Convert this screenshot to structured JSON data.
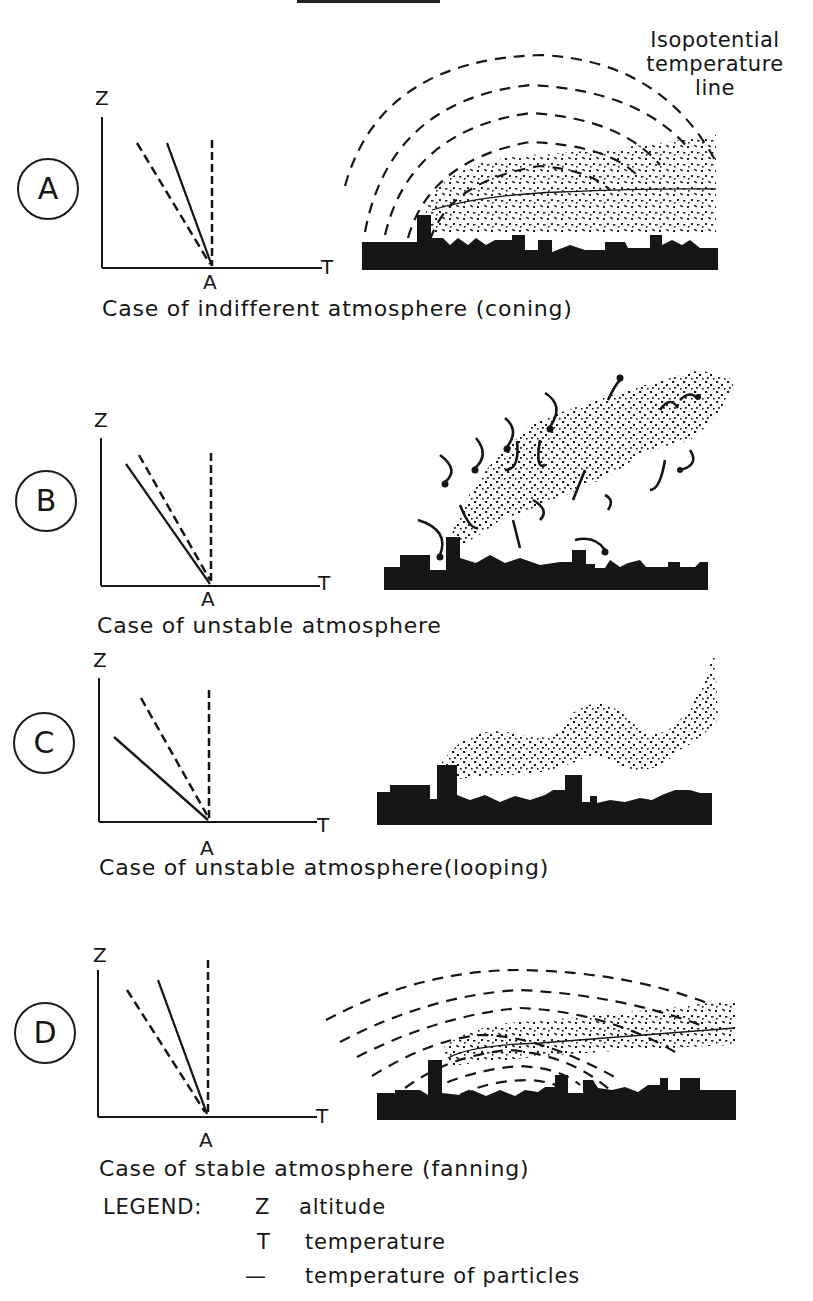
{
  "header": {
    "callout_label": [
      "Isopotential",
      "temperature",
      "line"
    ]
  },
  "panels": [
    {
      "id": "A",
      "caption": "Case of indifferent atmosphere (coning)",
      "plume_type": "coning",
      "axis_labels": {
        "y": "Z",
        "x": "T",
        "origin": "A"
      }
    },
    {
      "id": "B",
      "caption": "Case of unstable atmosphere",
      "plume_type": "unstable-turbulent",
      "axis_labels": {
        "y": "Z",
        "x": "T",
        "origin": "A"
      }
    },
    {
      "id": "C",
      "caption": "Case of unstable atmosphere(looping)",
      "plume_type": "looping",
      "axis_labels": {
        "y": "Z",
        "x": "T",
        "origin": "A"
      }
    },
    {
      "id": "D",
      "caption": "Case of stable atmosphere (fanning)",
      "plume_type": "fanning",
      "axis_labels": {
        "y": "Z",
        "x": "T",
        "origin": "A"
      }
    }
  ],
  "legend": {
    "title": "LEGEND:",
    "items": [
      {
        "symbol": "Z",
        "label": "altitude"
      },
      {
        "symbol": "T",
        "label": "temperature"
      },
      {
        "symbol": "—",
        "label": "temperature of particles"
      }
    ]
  },
  "colors": {
    "ink": "#161616",
    "background": "#ffffff"
  }
}
